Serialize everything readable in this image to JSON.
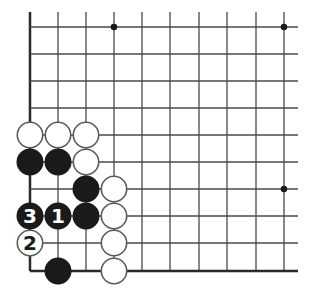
{
  "diagram": {
    "type": "go-board-fragment",
    "colors": {
      "background": "#ffffff",
      "line": "#4a4a4a",
      "edge": "#2a2a2a",
      "black_stone": "#1a1a1a",
      "white_stone_fill": "#ffffff",
      "white_stone_stroke": "#5a5a5a",
      "black_label": "#ffffff",
      "white_label": "#1a1a1a"
    },
    "grid": {
      "columns_x": [
        30,
        58,
        86,
        114,
        142,
        170,
        199,
        227,
        256,
        284
      ],
      "rows_y": [
        27,
        54,
        81,
        108,
        135,
        162,
        189,
        216,
        243,
        271
      ],
      "left_edge": true,
      "bottom_edge": true,
      "line_top_extent": 12,
      "line_right_extent": 298
    },
    "star_points": [
      {
        "col": 3,
        "row": 0
      },
      {
        "col": 9,
        "row": 0
      },
      {
        "col": 9,
        "row": 6
      }
    ],
    "stones": [
      {
        "color": "white",
        "col": 0,
        "row": 4,
        "label": ""
      },
      {
        "color": "white",
        "col": 1,
        "row": 4,
        "label": ""
      },
      {
        "color": "white",
        "col": 2,
        "row": 4,
        "label": ""
      },
      {
        "color": "black",
        "col": 0,
        "row": 5,
        "label": ""
      },
      {
        "color": "black",
        "col": 1,
        "row": 5,
        "label": ""
      },
      {
        "color": "white",
        "col": 2,
        "row": 5,
        "label": ""
      },
      {
        "color": "black",
        "col": 2,
        "row": 6,
        "label": ""
      },
      {
        "color": "white",
        "col": 3,
        "row": 6,
        "label": ""
      },
      {
        "color": "black",
        "col": 0,
        "row": 7,
        "label": "3"
      },
      {
        "color": "black",
        "col": 1,
        "row": 7,
        "label": "1"
      },
      {
        "color": "black",
        "col": 2,
        "row": 7,
        "label": ""
      },
      {
        "color": "white",
        "col": 3,
        "row": 7,
        "label": ""
      },
      {
        "color": "white",
        "col": 0,
        "row": 8,
        "label": "2"
      },
      {
        "color": "white",
        "col": 3,
        "row": 8,
        "label": ""
      },
      {
        "color": "black",
        "col": 1,
        "row": 9,
        "label": ""
      },
      {
        "color": "white",
        "col": 3,
        "row": 9,
        "label": ""
      }
    ],
    "stone_radius": 13.5
  }
}
